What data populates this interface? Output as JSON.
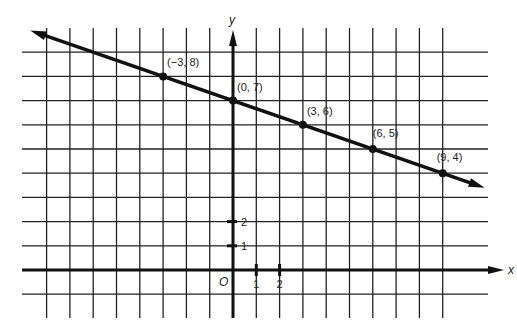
{
  "chart_data": {
    "type": "line",
    "title": "",
    "xlabel": "x",
    "ylabel": "y",
    "origin_label": "O",
    "x_ticks": [
      {
        "value": 1,
        "label": "1"
      },
      {
        "value": 2,
        "label": "2"
      }
    ],
    "y_ticks": [
      {
        "value": 1,
        "label": "1"
      },
      {
        "value": 2,
        "label": "2"
      }
    ],
    "grid": true,
    "xlim": [
      -8,
      9.5
    ],
    "ylim": [
      -1,
      9
    ],
    "series": [
      {
        "name": "line",
        "equation": "y = -x/3 + 7",
        "points": [
          {
            "x": -3,
            "y": 8,
            "label": "(−3, 8)"
          },
          {
            "x": 0,
            "y": 7,
            "label": "(0, 7)"
          },
          {
            "x": 3,
            "y": 6,
            "label": "(3, 6)"
          },
          {
            "x": 6,
            "y": 5,
            "label": "(6, 5)"
          },
          {
            "x": 9,
            "y": 4,
            "label": "(9, 4)"
          }
        ]
      }
    ]
  }
}
